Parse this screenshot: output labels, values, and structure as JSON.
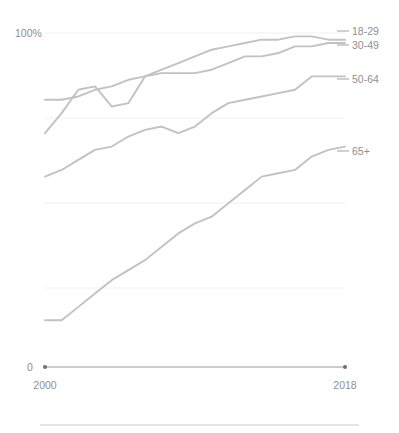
{
  "chart_data": {
    "type": "line",
    "title": "",
    "subtitle": "",
    "xlabel": "",
    "ylabel": "",
    "xlim": [
      2000,
      2018
    ],
    "ylim": [
      0,
      100
    ],
    "grid": true,
    "gridlines_y": [
      0,
      25,
      50,
      75,
      100
    ],
    "legend_position": "right-end-of-line",
    "y_axis_top_label": "100%",
    "y_axis_zero_label": "0",
    "x_tick_labels": [
      "2000",
      "2018"
    ],
    "x": [
      2000,
      2001,
      2002,
      2003,
      2004,
      2005,
      2006,
      2007,
      2008,
      2009,
      2010,
      2011,
      2012,
      2013,
      2014,
      2015,
      2016,
      2017,
      2018
    ],
    "series": [
      {
        "name": "18-29",
        "color": "#c2c2c2",
        "values": [
          70,
          76,
          83,
          84,
          78,
          79,
          87,
          89,
          91,
          93,
          95,
          96,
          97,
          98,
          98,
          99,
          99,
          98,
          98
        ]
      },
      {
        "name": "30-49",
        "color": "#c2c2c2",
        "values": [
          80,
          80,
          81,
          83,
          84,
          86,
          87,
          88,
          88,
          88,
          89,
          91,
          93,
          93,
          94,
          96,
          96,
          97,
          97
        ]
      },
      {
        "name": "50-64",
        "color": "#c2c2c2",
        "values": [
          57,
          59,
          62,
          65,
          66,
          69,
          71,
          72,
          70,
          72,
          76,
          79,
          80,
          81,
          82,
          83,
          87,
          87,
          87
        ]
      },
      {
        "name": "65+",
        "color": "#c2c2c2",
        "values": [
          14,
          14,
          18,
          22,
          26,
          29,
          32,
          36,
          40,
          43,
          45,
          49,
          53,
          57,
          58,
          59,
          63,
          65,
          66
        ]
      }
    ]
  },
  "legend": {
    "items": [
      {
        "label": "18-29"
      },
      {
        "label": "30-49"
      },
      {
        "label": "50-64"
      },
      {
        "label": "65+"
      }
    ]
  },
  "axes": {
    "y_top": "100%",
    "y_zero": "0",
    "x_start": "2000",
    "x_end": "2018"
  }
}
